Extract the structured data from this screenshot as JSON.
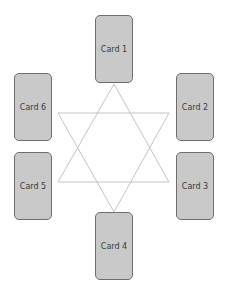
{
  "diagram": {
    "colors": {
      "card_fill": "#c9c9c9",
      "card_border": "#6e6e6e",
      "star_line": "#c4c4c4",
      "label": "#3a3a3a"
    },
    "cards": [
      {
        "id": 1,
        "label": "Card 1",
        "x": 95,
        "y": 15
      },
      {
        "id": 2,
        "label": "Card 2",
        "x": 176,
        "y": 73
      },
      {
        "id": 3,
        "label": "Card 3",
        "x": 176,
        "y": 152
      },
      {
        "id": 4,
        "label": "Card 4",
        "x": 95,
        "y": 212
      },
      {
        "id": 5,
        "label": "Card 5",
        "x": 14,
        "y": 152
      },
      {
        "id": 6,
        "label": "Card 6",
        "x": 14,
        "y": 73
      }
    ],
    "star": {
      "triangle_up": [
        [
          114,
          84
        ],
        [
          58,
          182
        ],
        [
          169,
          182
        ]
      ],
      "triangle_down": [
        [
          58,
          113
        ],
        [
          169,
          113
        ],
        [
          114,
          212
        ]
      ]
    }
  }
}
